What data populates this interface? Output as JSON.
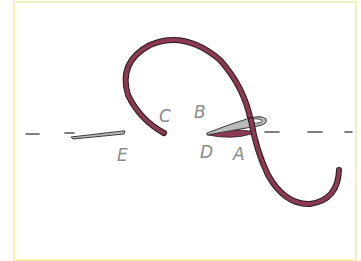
{
  "diagram": {
    "type": "embroidery-stitch-illustration",
    "labels": {
      "A": "A",
      "B": "B",
      "C": "C",
      "D": "D",
      "E": "E"
    },
    "colors": {
      "thread": "#8b3a52",
      "thread_outline": "#2a1a1e",
      "needle": "#b9bcb8",
      "needle_outline": "#3a3a3a",
      "dash_line": "#555555",
      "label": "#8a8a8a",
      "frame_border": "#f5f0b8"
    }
  }
}
